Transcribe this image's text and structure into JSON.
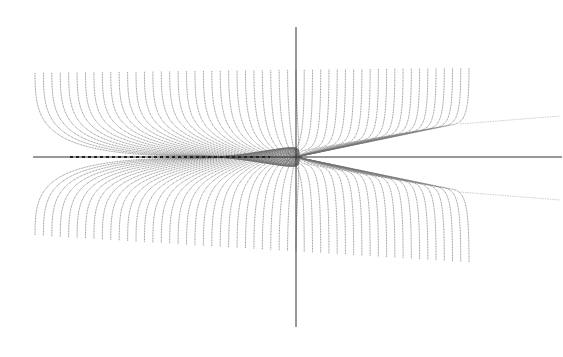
{
  "chart_data": {
    "type": "line",
    "title": "",
    "xlabel": "",
    "ylabel": "",
    "grid": false,
    "legend": null,
    "axes": {
      "origin_px": [
        296,
        157
      ],
      "horizontal": {
        "x1": 33,
        "x2": 562
      },
      "vertical": {
        "y1": 27,
        "y2": 327
      }
    },
    "curves": {
      "count_left": 31,
      "count_right": 21,
      "x_start": 35,
      "x_end": 469,
      "top_left_y": 73,
      "top_right_y": 68,
      "bottom_left_y": 235,
      "bottom_right_y": 262
    },
    "extension_lines": [
      {
        "from": [
          460,
          124
        ],
        "to": [
          560,
          116
        ]
      },
      {
        "from": [
          460,
          192
        ],
        "to": [
          560,
          200
        ]
      }
    ],
    "center_dash": {
      "from": [
        70,
        157
      ],
      "to": [
        270,
        157
      ]
    },
    "colors": {
      "curve": "#6e6e6e",
      "axis": "#333333",
      "extension": "#b8b8b8",
      "background": "#ffffff"
    }
  }
}
